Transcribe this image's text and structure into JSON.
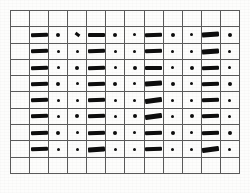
{
  "figure": {
    "title": "",
    "colors": {
      "background": "#fdfdfc",
      "grid_line": "#5a5a5a",
      "mark": "#0d0d0d"
    },
    "grid": {
      "columns": 12,
      "rows": 10,
      "cell_width_px": 19,
      "cell_height_px": 16
    }
  },
  "chart_data": {
    "type": "heatmap",
    "title": "",
    "xlabel": "",
    "ylabel": "",
    "columns": 12,
    "rows": 10,
    "legend": [
      {
        "key": "dash",
        "label": "thick horizontal dash"
      },
      {
        "key": "dot",
        "label": "small dot"
      },
      {
        "key": "tick",
        "label": "short slanted tick"
      },
      {
        "key": "none",
        "label": "empty cell"
      }
    ],
    "cells": [
      [
        "none",
        "none",
        "none",
        "none",
        "none",
        "none",
        "none",
        "none",
        "none",
        "none",
        "none",
        "none"
      ],
      [
        "none",
        "dash",
        "dot",
        "tick",
        "dash",
        "dot",
        "dot",
        "dash",
        "dot",
        "dot",
        "dash",
        "dot"
      ],
      [
        "none",
        "dash",
        "dot",
        "dot",
        "dash",
        "dot",
        "dot",
        "dash",
        "dot",
        "dot",
        "dash",
        "dot"
      ],
      [
        "none",
        "dash",
        "dot",
        "dot",
        "dash",
        "dot",
        "dot",
        "dash",
        "dot",
        "dot",
        "dash",
        "dot"
      ],
      [
        "none",
        "dash",
        "dot",
        "dot",
        "dash",
        "dot",
        "dot",
        "dash",
        "dot",
        "dot",
        "dash",
        "dot"
      ],
      [
        "none",
        "dash",
        "dot",
        "dot",
        "dash",
        "dot",
        "dot",
        "dash",
        "dot",
        "dot",
        "dash",
        "dot"
      ],
      [
        "none",
        "dash",
        "dot",
        "dot",
        "dash",
        "dot",
        "dot",
        "dash",
        "dot",
        "dot",
        "dash",
        "dot"
      ],
      [
        "none",
        "dash",
        "dot",
        "dot",
        "dash",
        "dot",
        "dot",
        "dash",
        "dot",
        "dot",
        "dash",
        "dot"
      ],
      [
        "none",
        "dash",
        "dot",
        "dot",
        "dash",
        "dot",
        "dot",
        "dash",
        "dot",
        "dot",
        "dash",
        "dot"
      ],
      [
        "none",
        "none",
        "none",
        "none",
        "none",
        "none",
        "none",
        "none",
        "none",
        "none",
        "none",
        "none"
      ]
    ],
    "tilt": [
      [
        0,
        0,
        0,
        0,
        0,
        0,
        0,
        0,
        0,
        0,
        0,
        0
      ],
      [
        0,
        1,
        0,
        0,
        0,
        0,
        0,
        1,
        0,
        0,
        2,
        0
      ],
      [
        0,
        1,
        0,
        0,
        1,
        0,
        0,
        1,
        0,
        0,
        2,
        0
      ],
      [
        0,
        1,
        0,
        0,
        1,
        0,
        0,
        0,
        0,
        0,
        1,
        0
      ],
      [
        0,
        1,
        0,
        0,
        1,
        0,
        0,
        2,
        0,
        0,
        1,
        0
      ],
      [
        0,
        1,
        0,
        0,
        1,
        0,
        0,
        3,
        0,
        0,
        1,
        0
      ],
      [
        0,
        1,
        0,
        0,
        1,
        0,
        0,
        3,
        0,
        0,
        1,
        0
      ],
      [
        0,
        1,
        0,
        0,
        1,
        0,
        0,
        1,
        0,
        0,
        1,
        0
      ],
      [
        0,
        1,
        0,
        0,
        2,
        0,
        0,
        1,
        0,
        0,
        3,
        0
      ],
      [
        0,
        0,
        0,
        0,
        0,
        0,
        0,
        0,
        0,
        0,
        0,
        0
      ]
    ]
  }
}
